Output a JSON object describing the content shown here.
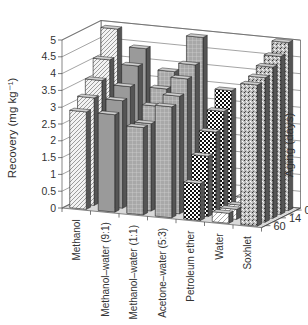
{
  "chart_data": {
    "type": "bar",
    "subtype": "3d-bar",
    "title": "",
    "ylabel": "Recovery (mg kg⁻¹)",
    "zlabel": "Aging (days)",
    "ylim": [
      0,
      5
    ],
    "yticks": [
      "0",
      "0.5",
      "1",
      "1.5",
      "2",
      "2.5",
      "3",
      "3.5",
      "4",
      "4.5",
      "5"
    ],
    "grid": true,
    "categories": [
      "Methanol",
      "Methanol–water (9:1)",
      "Methanol–water (1:1)",
      "Acetone–water (5:3)",
      "Petroleum ether",
      "Water",
      "Soxhlet"
    ],
    "depth_tick_labels": [
      "0",
      "",
      "14",
      "",
      "60"
    ],
    "series": [
      {
        "name": "0",
        "values": [
          4.9,
          4.4,
          3.8,
          4.9,
          3.4,
          0.6,
          5.0
        ]
      },
      {
        "name": "",
        "values": [
          4.1,
          4.0,
          3.4,
          4.2,
          2.9,
          0.4,
          4.7
        ]
      },
      {
        "name": "14",
        "values": [
          3.6,
          3.5,
          3.0,
          3.9,
          2.4,
          0.3,
          4.5
        ]
      },
      {
        "name": "",
        "values": [
          3.2,
          3.2,
          2.6,
          3.5,
          1.8,
          0.3,
          4.3
        ]
      },
      {
        "name": "60",
        "values": [
          2.9,
          2.9,
          2.6,
          3.3,
          1.1,
          0.3,
          4.2
        ]
      }
    ],
    "patterns": [
      "diag",
      "solid",
      "grid",
      "grid",
      "checker",
      "diagwhite",
      "speckle"
    ]
  }
}
